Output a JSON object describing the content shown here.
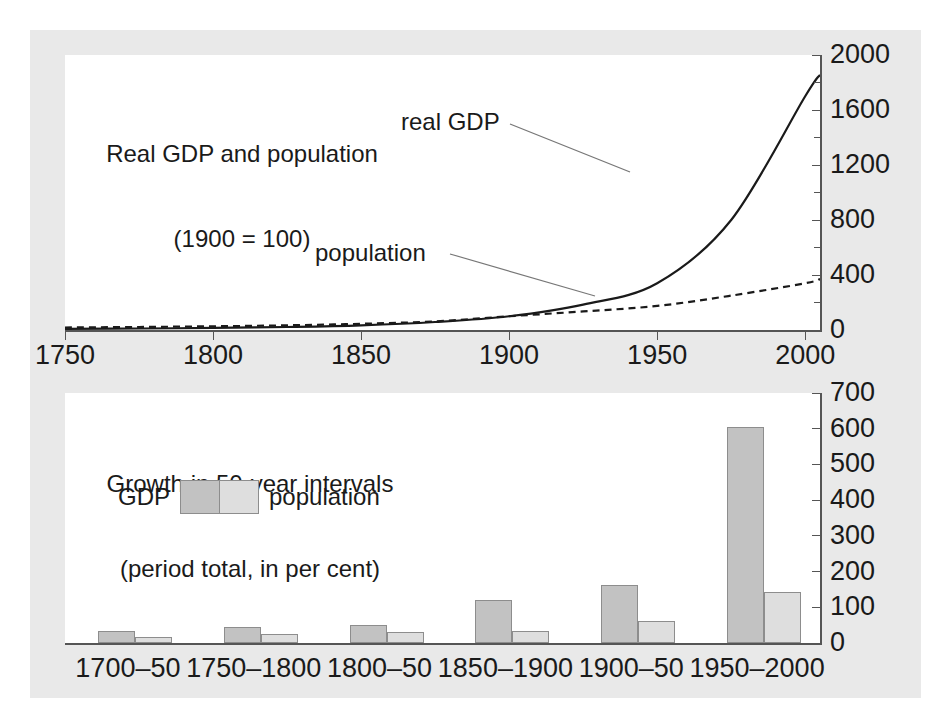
{
  "figure": {
    "background_color": "#e9e9e9",
    "plot_background_color": "#ffffff",
    "axis_color": "#555555",
    "gdp_color": "#c2c2c2",
    "population_color": "#dedede"
  },
  "top_chart": {
    "title_line1": "Real GDP and population",
    "title_line2": "(1900 = 100)",
    "annotation_gdp": "real GDP",
    "annotation_population": "population",
    "y_ticks": [
      "0",
      "400",
      "800",
      "1200",
      "1600",
      "2000"
    ],
    "x_ticks": [
      "1750",
      "1800",
      "1850",
      "1900",
      "1950",
      "2000"
    ]
  },
  "bottom_chart": {
    "title_line1": "Growth in 50-year intervals",
    "title_line2": "(period total, in per cent)",
    "legend_gdp": "GDP",
    "legend_population": "population",
    "y_ticks": [
      "0",
      "100",
      "200",
      "300",
      "400",
      "500",
      "600",
      "700"
    ],
    "x_ticks": [
      "1700–50",
      "1750–1800",
      "1800–50",
      "1850–1900",
      "1900–50",
      "1950–2000"
    ]
  },
  "chart_data": [
    {
      "type": "line",
      "title": "Real GDP and population (1900 = 100)",
      "xlabel": "",
      "ylabel": "",
      "xlim": [
        1750,
        2005
      ],
      "ylim": [
        0,
        2000
      ],
      "y_axis_position": "right",
      "y_ticks_major": [
        0,
        400,
        800,
        1200,
        1600,
        2000
      ],
      "y_ticks_minor": [
        200,
        600,
        1000,
        1400,
        1800
      ],
      "x_ticks": [
        1750,
        1800,
        1850,
        1900,
        1950,
        2000
      ],
      "grid": false,
      "legend_position": "annotations-on-curves",
      "x": [
        1750,
        1775,
        1800,
        1825,
        1850,
        1875,
        1900,
        1925,
        1950,
        1975,
        2000,
        2005
      ],
      "series": [
        {
          "name": "real GDP",
          "style": "solid",
          "values": [
            8,
            11,
            15,
            22,
            34,
            58,
            100,
            185,
            340,
            800,
            1700,
            1855
          ]
        },
        {
          "name": "population",
          "style": "dashed",
          "values": [
            18,
            22,
            27,
            34,
            45,
            63,
            100,
            135,
            175,
            250,
            340,
            370
          ]
        }
      ],
      "annotations": [
        {
          "text": "real GDP",
          "x": 1905,
          "y": 1520
        },
        {
          "text": "population",
          "x": 1878,
          "y": 600
        }
      ]
    },
    {
      "type": "bar",
      "title": "Growth in 50-year intervals (period total, in per cent)",
      "xlabel": "",
      "ylabel": "",
      "ylim": [
        0,
        700
      ],
      "y_ticks": [
        0,
        100,
        200,
        300,
        400,
        500,
        600,
        700
      ],
      "grid": false,
      "legend_position": "inside-upper-left",
      "categories": [
        "1700–50",
        "1750–1800",
        "1800–50",
        "1850–1900",
        "1900–50",
        "1950–2000"
      ],
      "series": [
        {
          "name": "GDP",
          "values": [
            33,
            45,
            50,
            120,
            162,
            605
          ]
        },
        {
          "name": "population",
          "values": [
            16,
            26,
            30,
            33,
            63,
            143
          ]
        }
      ]
    }
  ]
}
